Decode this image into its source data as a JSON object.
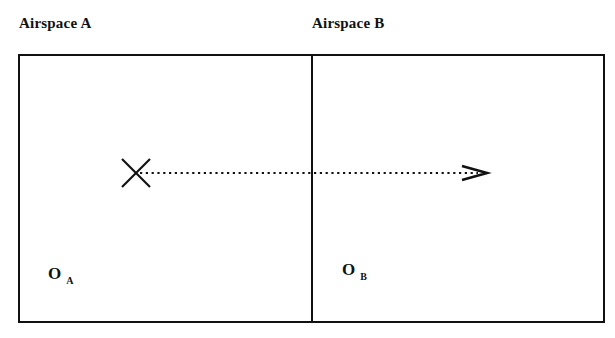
{
  "diagram": {
    "airspaces": [
      {
        "label": "Airspace A",
        "origin_label": "O",
        "origin_subscript": "A"
      },
      {
        "label": "Airspace B",
        "origin_label": "O",
        "origin_subscript": "B"
      }
    ],
    "marker": {
      "icon": "x-mark-icon",
      "meaning": "aircraft position"
    },
    "trajectory": {
      "style": "dotted",
      "direction": "A to B",
      "icon": "arrow-head-icon"
    },
    "colors": {
      "stroke": "#111111",
      "background": "#ffffff"
    }
  }
}
